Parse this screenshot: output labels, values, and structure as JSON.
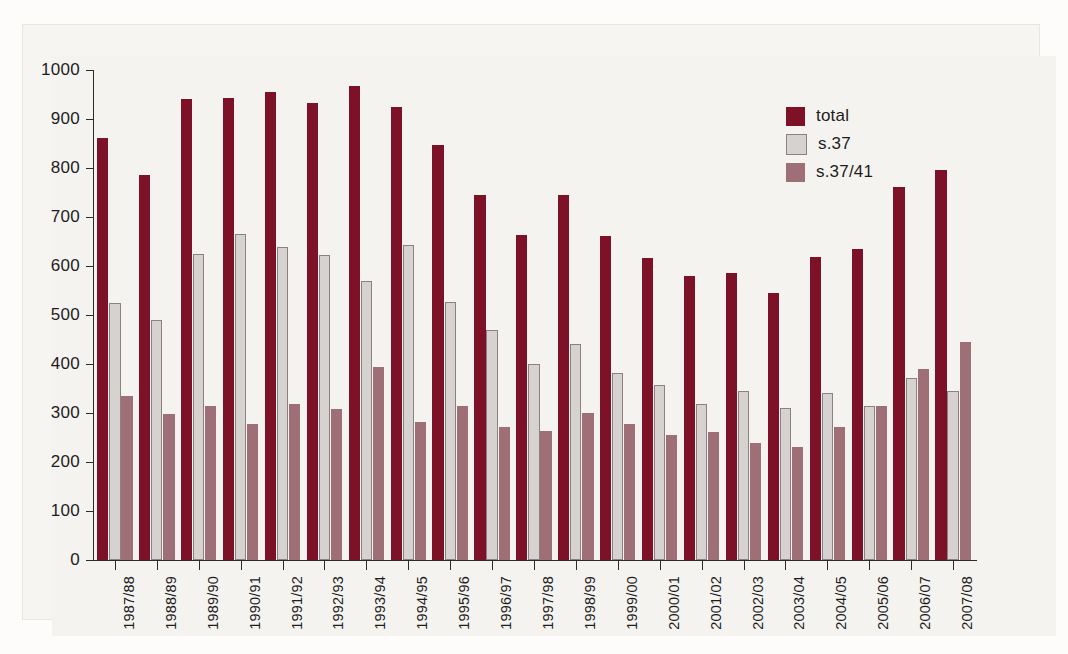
{
  "chart_data": {
    "type": "bar",
    "title": "",
    "subtitle": "",
    "xlabel": "",
    "ylabel": "",
    "ylim": [
      0,
      1000
    ],
    "ytick_values": [
      0,
      100,
      200,
      300,
      400,
      500,
      600,
      700,
      800,
      900,
      1000
    ],
    "ytick_labels": [
      "0",
      "100",
      "200",
      "300",
      "400",
      "500",
      "600",
      "700",
      "800",
      "900",
      "1000"
    ],
    "grid": false,
    "legend_position": "top-right",
    "categories": [
      "1987/88",
      "1988/89",
      "1989/90",
      "1990/91",
      "1991/92",
      "1992/93",
      "1993/94",
      "1994/95",
      "1995/96",
      "1996/97",
      "1997/98",
      "1998/99",
      "1999/00",
      "2000/01",
      "2001/02",
      "2002/03",
      "2003/04",
      "2004/05",
      "2005/06",
      "2006/07",
      "2007/08"
    ],
    "series": [
      {
        "name": "total",
        "color": "#7d1128",
        "values": [
          862,
          786,
          941,
          943,
          955,
          932,
          968,
          925,
          846,
          744,
          664,
          744,
          661,
          617,
          580,
          585,
          545,
          618,
          635,
          762,
          795
        ]
      },
      {
        "name": "s.37",
        "color": "#d6d2d0",
        "values": [
          524,
          489,
          624,
          665,
          639,
          622,
          569,
          643,
          526,
          470,
          401,
          441,
          382,
          358,
          319,
          345,
          311,
          341,
          314,
          372,
          345
        ]
      },
      {
        "name": "s.37/41",
        "color": "#9e6f76",
        "values": [
          335,
          298,
          315,
          278,
          319,
          308,
          394,
          281,
          315,
          272,
          263,
          300,
          277,
          255,
          261,
          239,
          231,
          271,
          314,
          390,
          445
        ]
      }
    ]
  },
  "legend": {
    "items": [
      {
        "label": "total",
        "color": "#7d1128"
      },
      {
        "label": "s.37",
        "color": "#d6d2d0"
      },
      {
        "label": "s.37/41",
        "color": "#9e6f76"
      }
    ]
  }
}
